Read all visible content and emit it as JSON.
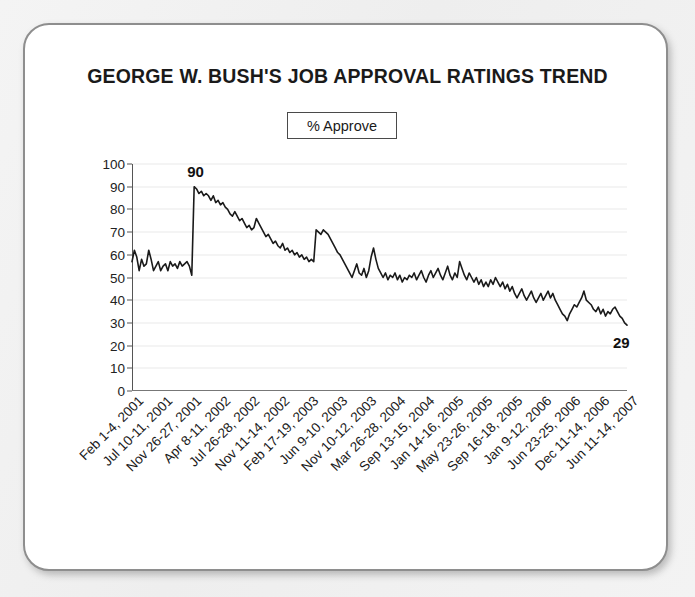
{
  "card": {
    "title": "GEORGE W. BUSH'S JOB APPROVAL RATINGS TREND"
  },
  "legend": {
    "label": "% Approve"
  },
  "chart_data": {
    "type": "line",
    "title": "GEORGE W. BUSH'S JOB APPROVAL RATINGS TREND",
    "xlabel": "",
    "ylabel": "",
    "ylim": [
      0,
      100
    ],
    "ytick_step": 10,
    "yticks": [
      0,
      10,
      20,
      30,
      40,
      50,
      60,
      70,
      80,
      90,
      100
    ],
    "grid": true,
    "legend_position": "top-center",
    "line_color": "#1a1a1a",
    "series": [
      {
        "name": "% Approve",
        "values": [
          57,
          62,
          59,
          53,
          58,
          55,
          56,
          62,
          58,
          53,
          55,
          57,
          53,
          55,
          56,
          53,
          57,
          55,
          56,
          54,
          57,
          55,
          56,
          57,
          55,
          51,
          90,
          89,
          87,
          88,
          86,
          87,
          86,
          84,
          86,
          83,
          84,
          82,
          83,
          81,
          80,
          78,
          77,
          79,
          77,
          75,
          76,
          74,
          72,
          73,
          71,
          72,
          76,
          74,
          72,
          70,
          68,
          69,
          67,
          65,
          66,
          64,
          63,
          65,
          62,
          63,
          61,
          62,
          60,
          61,
          59,
          60,
          58,
          59,
          57,
          58,
          57,
          71,
          70,
          69,
          71,
          70,
          69,
          67,
          65,
          63,
          61,
          60,
          58,
          56,
          54,
          52,
          50,
          53,
          56,
          52,
          51,
          54,
          50,
          53,
          59,
          63,
          58,
          54,
          52,
          50,
          52,
          49,
          51,
          50,
          52,
          49,
          51,
          48,
          50,
          49,
          51,
          50,
          52,
          49,
          51,
          53,
          50,
          48,
          51,
          53,
          50,
          52,
          54,
          51,
          49,
          52,
          55,
          51,
          49,
          52,
          50,
          57,
          54,
          51,
          49,
          52,
          50,
          48,
          50,
          47,
          49,
          46,
          48,
          46,
          49,
          47,
          50,
          48,
          46,
          48,
          45,
          47,
          44,
          46,
          43,
          41,
          43,
          45,
          42,
          40,
          42,
          44,
          41,
          39,
          41,
          43,
          40,
          42,
          44,
          41,
          43,
          40,
          38,
          36,
          34,
          33,
          31,
          34,
          36,
          38,
          37,
          39,
          41,
          44,
          40,
          39,
          38,
          36,
          35,
          37,
          34,
          36,
          33,
          35,
          34,
          36,
          37,
          35,
          33,
          32,
          30,
          29
        ]
      }
    ],
    "x_tick_labels": [
      "Feb 1-4, 2001",
      "Jul 10-11, 2001",
      "Nov 26-27, 2001",
      "Apr 8-11, 2002",
      "Jul 26-28, 2002",
      "Nov 11-14, 2002",
      "Feb 17-19, 2003",
      "Jun 9-10, 2003",
      "Nov 10-12, 2003",
      "Mar 26-28, 2004",
      "Sep 13-15, 2004",
      "Jan 14-16, 2005",
      "May 23-26, 2005",
      "Sep 16-18, 2005",
      "Jan 9-12, 2006",
      "Jun 23-25, 2006",
      "Dec 11-14, 2006",
      "Jun 11-14, 2007"
    ],
    "annotations": [
      {
        "label": "90",
        "value": 90,
        "position": "peak"
      },
      {
        "label": "29",
        "value": 29,
        "position": "end"
      }
    ]
  }
}
